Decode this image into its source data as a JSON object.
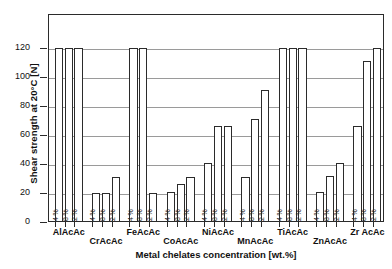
{
  "chart_data": {
    "type": "bar",
    "title": "",
    "xlabel": "Metal chelates concentration [wt.%]",
    "ylabel": "Shear strength at 20°C [N]",
    "ylim": [
      0,
      130
    ],
    "yticks": [
      0,
      20,
      40,
      60,
      80,
      100,
      120
    ],
    "ytick_labels": [
      "0",
      "20",
      "40",
      "60",
      "80",
      "100",
      "120"
    ],
    "grid": true,
    "legend": "none",
    "axis_clip_note": "Bars reaching 120 are clipped at the 120 gridline (value >= 120)",
    "categories": [
      "AlAcAc",
      "CrAcAc",
      "FeAcAc",
      "CoAcAc",
      "NiAcAc",
      "MnAcAc",
      "TiAcAc",
      "ZnAcAc",
      "ZrAcAc"
    ],
    "series": [
      {
        "name": "0.4%",
        "values": [
          120,
          20,
          120,
          21,
          41,
          31,
          120,
          21,
          66
        ]
      },
      {
        "name": "0.8%",
        "values": [
          120,
          20,
          120,
          26,
          66,
          71,
          120,
          32,
          111
        ]
      },
      {
        "name": "1.2%",
        "values": [
          120,
          31,
          20,
          31,
          66,
          91,
          120,
          41,
          120
        ]
      }
    ],
    "bar_labels": [
      "0.4 %",
      "0.8 %",
      "1.2 %"
    ],
    "groups": [
      {
        "name": "AlAcAc",
        "row": 0,
        "bars": [
          {
            "label": "0.4 %",
            "value": 120,
            "clipped": true
          },
          {
            "label": "0.8 %",
            "value": 120,
            "clipped": true
          },
          {
            "label": "1.2 %",
            "value": 120,
            "clipped": true
          }
        ]
      },
      {
        "name": "CrAcAc",
        "row": 1,
        "bars": [
          {
            "label": "0.4 %",
            "value": 20,
            "clipped": false
          },
          {
            "label": "0.8 %",
            "value": 20,
            "clipped": false
          },
          {
            "label": "1.2 %",
            "value": 31,
            "clipped": false
          }
        ]
      },
      {
        "name": "FeAcAc",
        "row": 0,
        "bars": [
          {
            "label": "0.4 %",
            "value": 120,
            "clipped": true
          },
          {
            "label": "0.8 %",
            "value": 120,
            "clipped": true
          },
          {
            "label": "1.2 %",
            "value": 20,
            "clipped": false
          }
        ]
      },
      {
        "name": "CoAcAc",
        "row": 1,
        "bars": [
          {
            "label": "0.4 %",
            "value": 21,
            "clipped": false
          },
          {
            "label": "0.8 %",
            "value": 26,
            "clipped": false
          },
          {
            "label": "1.2 %",
            "value": 31,
            "clipped": false
          }
        ]
      },
      {
        "name": "NiAcAc",
        "row": 0,
        "bars": [
          {
            "label": "0.4 %",
            "value": 41,
            "clipped": false
          },
          {
            "label": "0.8 %",
            "value": 66,
            "clipped": false
          },
          {
            "label": "1.2 %",
            "value": 66,
            "clipped": false
          }
        ]
      },
      {
        "name": "MnAcAc",
        "row": 1,
        "bars": [
          {
            "label": "0.4 %",
            "value": 31,
            "clipped": false
          },
          {
            "label": "0.8 %",
            "value": 71,
            "clipped": false
          },
          {
            "label": "1.2 %",
            "value": 91,
            "clipped": false
          }
        ]
      },
      {
        "name": "TiAcAc",
        "row": 0,
        "bars": [
          {
            "label": "0.4 %",
            "value": 120,
            "clipped": true
          },
          {
            "label": "0.8 %",
            "value": 120,
            "clipped": true
          },
          {
            "label": "1.2 %",
            "value": 120,
            "clipped": true
          }
        ]
      },
      {
        "name": "ZnAcAc",
        "row": 1,
        "bars": [
          {
            "label": "0.4 %",
            "value": 21,
            "clipped": false
          },
          {
            "label": "0.8 %",
            "value": 32,
            "clipped": false
          },
          {
            "label": "1.2 %",
            "value": 41,
            "clipped": false
          }
        ]
      },
      {
        "name": "Zr AcAc",
        "row": 0,
        "bars": [
          {
            "label": "0.4 %",
            "value": 66,
            "clipped": false
          },
          {
            "label": "0.8 %",
            "value": 111,
            "clipped": false
          },
          {
            "label": "1.2 %",
            "value": 120,
            "clipped": true
          }
        ]
      }
    ],
    "colors": {
      "bar_fill": "#ffffff",
      "bar_stroke": "#2b2b2b",
      "grid": "#9a9a9a",
      "axis": "#2b2b2b",
      "text": "#111111",
      "background": "#ffffff"
    }
  }
}
